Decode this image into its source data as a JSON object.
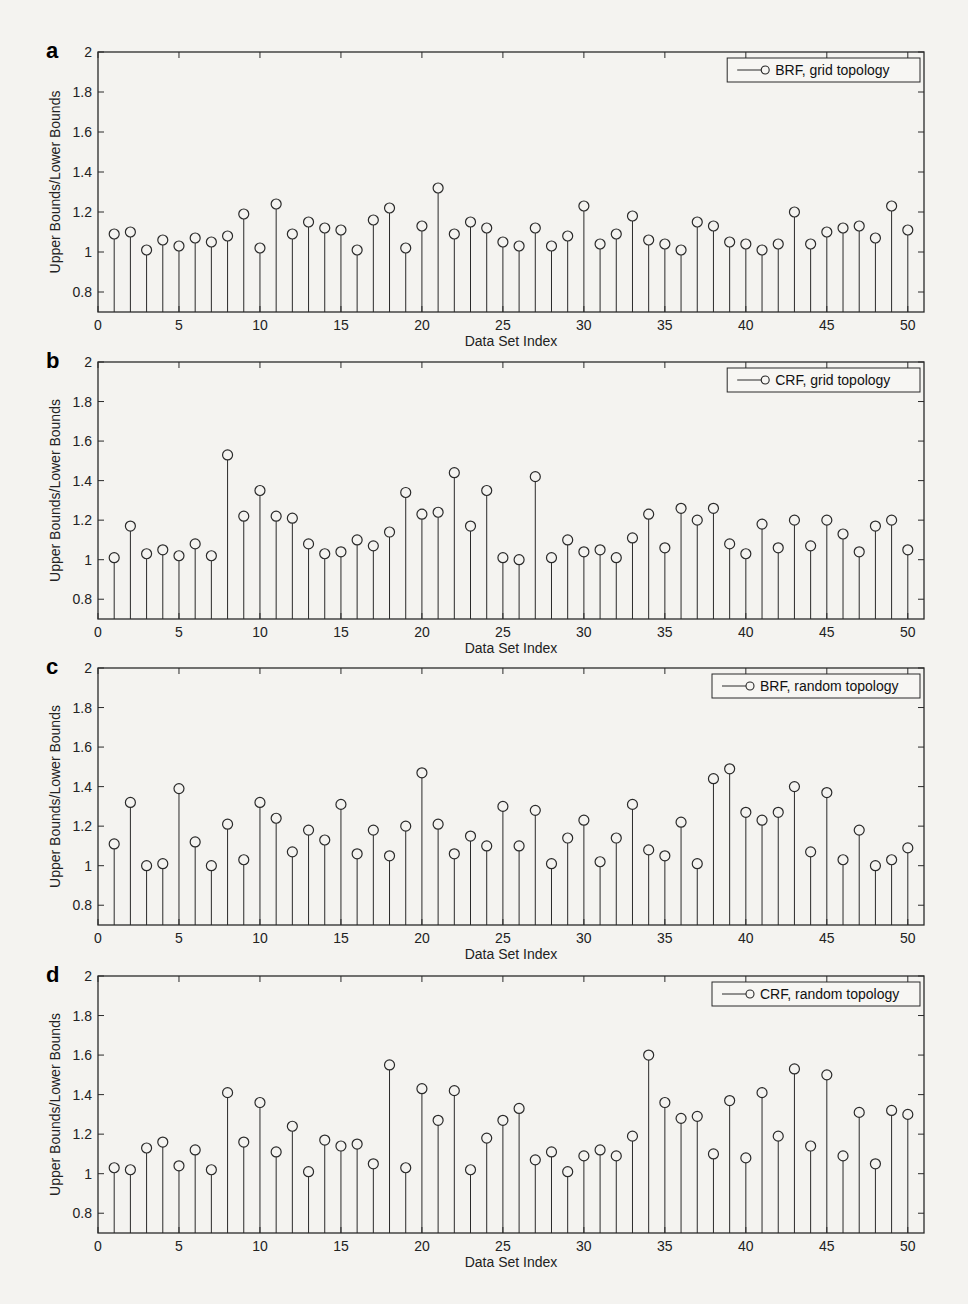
{
  "figure": {
    "panels": [
      {
        "letter": "a",
        "legend": "BRF, grid topology"
      },
      {
        "letter": "b",
        "legend": "CRF, grid topology"
      },
      {
        "letter": "c",
        "legend": "BRF, random topology"
      },
      {
        "letter": "d",
        "legend": "CRF, random topology"
      }
    ],
    "xlabel": "Data Set Index",
    "ylabel": "Upper Bounds/Lower Bounds"
  },
  "chart_data": [
    {
      "type": "stem",
      "panel": "a",
      "title": "",
      "legend": [
        "BRF, grid topology"
      ],
      "xlabel": "Data Set Index",
      "ylabel": "Upper Bounds/Lower Bounds",
      "xlim": [
        0,
        51
      ],
      "ylim": [
        0.7,
        2
      ],
      "xticks": [
        0,
        5,
        10,
        15,
        20,
        25,
        30,
        35,
        40,
        45,
        50
      ],
      "yticks": [
        0.8,
        1,
        1.2,
        1.4,
        1.6,
        1.8,
        2
      ],
      "grid": false,
      "legend_position": "upper right",
      "x": [
        1,
        2,
        3,
        4,
        5,
        6,
        7,
        8,
        9,
        10,
        11,
        12,
        13,
        14,
        15,
        16,
        17,
        18,
        19,
        20,
        21,
        22,
        23,
        24,
        25,
        26,
        27,
        28,
        29,
        30,
        31,
        32,
        33,
        34,
        35,
        36,
        37,
        38,
        39,
        40,
        41,
        42,
        43,
        44,
        45,
        46,
        47,
        48,
        49,
        50
      ],
      "values": [
        1.09,
        1.1,
        1.01,
        1.06,
        1.03,
        1.07,
        1.05,
        1.08,
        1.19,
        1.02,
        1.24,
        1.09,
        1.15,
        1.12,
        1.11,
        1.01,
        1.16,
        1.22,
        1.02,
        1.13,
        1.32,
        1.09,
        1.15,
        1.12,
        1.05,
        1.03,
        1.12,
        1.03,
        1.08,
        1.23,
        1.04,
        1.09,
        1.18,
        1.06,
        1.04,
        1.01,
        1.15,
        1.13,
        1.05,
        1.04,
        1.01,
        1.04,
        1.2,
        1.04,
        1.1,
        1.12,
        1.13,
        1.07,
        1.23,
        1.11
      ]
    },
    {
      "type": "stem",
      "panel": "b",
      "title": "",
      "legend": [
        "CRF, grid topology"
      ],
      "xlabel": "Data Set Index",
      "ylabel": "Upper Bounds/Lower Bounds",
      "xlim": [
        0,
        51
      ],
      "ylim": [
        0.7,
        2
      ],
      "xticks": [
        0,
        5,
        10,
        15,
        20,
        25,
        30,
        35,
        40,
        45,
        50
      ],
      "yticks": [
        0.8,
        1,
        1.2,
        1.4,
        1.6,
        1.8,
        2
      ],
      "grid": false,
      "legend_position": "upper right",
      "x": [
        1,
        2,
        3,
        4,
        5,
        6,
        7,
        8,
        9,
        10,
        11,
        12,
        13,
        14,
        15,
        16,
        17,
        18,
        19,
        20,
        21,
        22,
        23,
        24,
        25,
        26,
        27,
        28,
        29,
        30,
        31,
        32,
        33,
        34,
        35,
        36,
        37,
        38,
        39,
        40,
        41,
        42,
        43,
        44,
        45,
        46,
        47,
        48,
        49,
        50
      ],
      "values": [
        1.01,
        1.17,
        1.03,
        1.05,
        1.02,
        1.08,
        1.02,
        1.53,
        1.22,
        1.35,
        1.22,
        1.21,
        1.08,
        1.03,
        1.04,
        1.1,
        1.07,
        1.14,
        1.34,
        1.23,
        1.24,
        1.44,
        1.17,
        1.35,
        1.01,
        1.0,
        1.42,
        1.01,
        1.1,
        1.04,
        1.05,
        1.01,
        1.11,
        1.23,
        1.06,
        1.26,
        1.2,
        1.26,
        1.08,
        1.03,
        1.18,
        1.06,
        1.2,
        1.07,
        1.2,
        1.13,
        1.04,
        1.17,
        1.2,
        1.05
      ]
    },
    {
      "type": "stem",
      "panel": "c",
      "title": "",
      "legend": [
        "BRF, random topology"
      ],
      "xlabel": "Data Set Index",
      "ylabel": "Upper Bounds/Lower Bounds",
      "xlim": [
        0,
        51
      ],
      "ylim": [
        0.7,
        2
      ],
      "xticks": [
        0,
        5,
        10,
        15,
        20,
        25,
        30,
        35,
        40,
        45,
        50
      ],
      "yticks": [
        0.8,
        1,
        1.2,
        1.4,
        1.6,
        1.8,
        2
      ],
      "grid": false,
      "legend_position": "upper right",
      "x": [
        1,
        2,
        3,
        4,
        5,
        6,
        7,
        8,
        9,
        10,
        11,
        12,
        13,
        14,
        15,
        16,
        17,
        18,
        19,
        20,
        21,
        22,
        23,
        24,
        25,
        26,
        27,
        28,
        29,
        30,
        31,
        32,
        33,
        34,
        35,
        36,
        37,
        38,
        39,
        40,
        41,
        42,
        43,
        44,
        45,
        46,
        47,
        48,
        49,
        50
      ],
      "values": [
        1.11,
        1.32,
        1.0,
        1.01,
        1.39,
        1.12,
        1.0,
        1.21,
        1.03,
        1.32,
        1.24,
        1.07,
        1.18,
        1.13,
        1.31,
        1.06,
        1.18,
        1.05,
        1.2,
        1.47,
        1.21,
        1.06,
        1.15,
        1.1,
        1.3,
        1.1,
        1.28,
        1.01,
        1.14,
        1.23,
        1.02,
        1.14,
        1.31,
        1.08,
        1.05,
        1.22,
        1.01,
        1.44,
        1.49,
        1.27,
        1.23,
        1.27,
        1.4,
        1.07,
        1.37,
        1.03,
        1.18,
        1.0,
        1.03,
        1.09
      ]
    },
    {
      "type": "stem",
      "panel": "d",
      "title": "",
      "legend": [
        "CRF, random topology"
      ],
      "xlabel": "Data Set Index",
      "ylabel": "Upper Bounds/Lower Bounds",
      "xlim": [
        0,
        51
      ],
      "ylim": [
        0.7,
        2
      ],
      "xticks": [
        0,
        5,
        10,
        15,
        20,
        25,
        30,
        35,
        40,
        45,
        50
      ],
      "yticks": [
        0.8,
        1,
        1.2,
        1.4,
        1.6,
        1.8,
        2
      ],
      "grid": false,
      "legend_position": "upper right",
      "x": [
        1,
        2,
        3,
        4,
        5,
        6,
        7,
        8,
        9,
        10,
        11,
        12,
        13,
        14,
        15,
        16,
        17,
        18,
        19,
        20,
        21,
        22,
        23,
        24,
        25,
        26,
        27,
        28,
        29,
        30,
        31,
        32,
        33,
        34,
        35,
        36,
        37,
        38,
        39,
        40,
        41,
        42,
        43,
        44,
        45,
        46,
        47,
        48,
        49,
        50
      ],
      "values": [
        1.03,
        1.02,
        1.13,
        1.16,
        1.04,
        1.12,
        1.02,
        1.41,
        1.16,
        1.36,
        1.11,
        1.24,
        1.01,
        1.17,
        1.14,
        1.15,
        1.05,
        1.55,
        1.03,
        1.43,
        1.27,
        1.42,
        1.02,
        1.18,
        1.27,
        1.33,
        1.07,
        1.11,
        1.01,
        1.09,
        1.12,
        1.09,
        1.19,
        1.6,
        1.36,
        1.28,
        1.29,
        1.1,
        1.37,
        1.08,
        1.41,
        1.19,
        1.53,
        1.14,
        1.5,
        1.09,
        1.31,
        1.05,
        1.32,
        1.3
      ]
    }
  ]
}
